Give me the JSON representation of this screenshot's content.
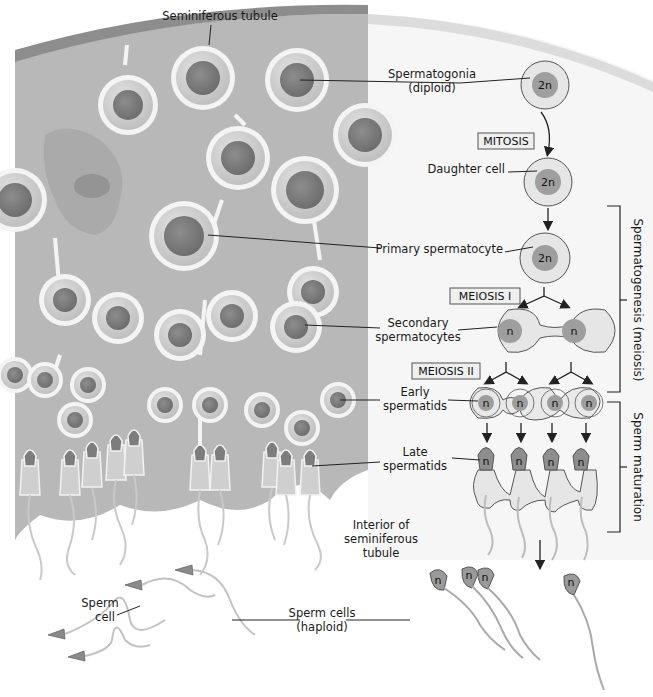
{
  "diagram": {
    "title_label": "Seminiferous tubule",
    "colors": {
      "tissue": "#b9b9b9",
      "tissue_dark": "#a2a2a2",
      "tubule_wall": "#8f8f8f",
      "right_bg": "#f4f4f4",
      "cell_fill": "#e6e6e6",
      "cell_outline": "#555555",
      "nucleus": "#9a9a9a",
      "nucleus_dark": "#7f7f7f",
      "box_fill": "#eeeeee",
      "box_stroke": "#555555"
    },
    "stages": [
      {
        "id": "spermatogonia",
        "label_line1": "Spermatogonia",
        "label_line2": "(diploid)",
        "ploidy": "2n"
      },
      {
        "id": "mitosis",
        "process": "MITOSIS"
      },
      {
        "id": "daughter",
        "label_line1": "Daughter cell",
        "ploidy": "2n"
      },
      {
        "id": "primary",
        "label_line1": "Primary spermatocyte",
        "ploidy": "2n"
      },
      {
        "id": "meiosis1",
        "process": "MEIOSIS I"
      },
      {
        "id": "secondary",
        "label_line1": "Secondary",
        "label_line2": "spermatocytes",
        "ploidy": "n"
      },
      {
        "id": "meiosis2",
        "process": "MEIOSIS II"
      },
      {
        "id": "early",
        "label_line1": "Early",
        "label_line2": "spermatids",
        "ploidy": "n"
      },
      {
        "id": "late",
        "label_line1": "Late",
        "label_line2": "spermatids",
        "ploidy": "n"
      }
    ],
    "brackets": [
      {
        "id": "spermatogenesis",
        "label": "Spermatogenesis (meiosis)"
      },
      {
        "id": "maturation",
        "label": "Sperm maturation"
      }
    ],
    "other_labels": {
      "interior_line1": "Interior of",
      "interior_line2": "seminiferous",
      "interior_line3": "tubule",
      "sperm_cell_line1": "Sperm",
      "sperm_cell_line2": "cell",
      "sperm_cells_line1": "Sperm cells",
      "sperm_cells_line2": "(haploid)"
    },
    "ploidy_labels": {
      "diploid": "2n",
      "haploid": "n"
    }
  }
}
